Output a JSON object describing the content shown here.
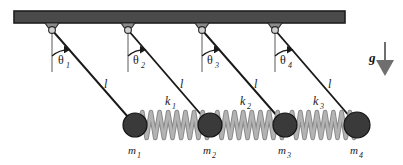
{
  "figure": {
    "type": "physics-diagram",
    "width": 403,
    "height": 165,
    "background": "#ffffff"
  },
  "colors": {
    "ceiling_fill": "#4a4a4a",
    "ceiling_stroke": "#1e1e1e",
    "bracket_fill": "#8c8c8c",
    "bracket_stroke": "#2a2a2a",
    "pin_fill": "#cfcfcf",
    "pin_stroke": "#2a2a2a",
    "rod": "#1a1a1a",
    "mass_fill": "#3a3a3a",
    "mass_stroke": "#141414",
    "spring_fill": "#b3b3b3",
    "spring_stroke": "#8a8a8a",
    "vertical_ref": "#5a5a5a",
    "text": "#1a1a1a",
    "gravity_arrow": "#6f6f6f"
  },
  "ceiling": {
    "name": "ceiling-bar",
    "x": 14,
    "y": 11,
    "width": 331,
    "height": 12
  },
  "pendulums": [
    {
      "id": "pendulum-1",
      "pivot_x": 52,
      "pivot_y": 30,
      "mass_x": 135,
      "mass_y": 125,
      "mass_radius": 12,
      "angle_label": "θ",
      "angle_sub": "1",
      "angle_label_x": 58,
      "angle_label_y": 64,
      "length_label": "l",
      "length_label_x": 104,
      "length_label_y": 88,
      "mass_label": "m",
      "mass_sub": "1",
      "mass_label_x": 128,
      "mass_label_y": 154
    },
    {
      "id": "pendulum-2",
      "pivot_x": 128,
      "pivot_y": 30,
      "mass_x": 210,
      "mass_y": 125,
      "mass_radius": 12,
      "angle_label": "θ",
      "angle_sub": "2",
      "angle_label_x": 133,
      "angle_label_y": 64,
      "length_label": "l",
      "length_label_x": 180,
      "length_label_y": 88,
      "mass_label": "m",
      "mass_sub": "2",
      "mass_label_x": 203,
      "mass_label_y": 154
    },
    {
      "id": "pendulum-3",
      "pivot_x": 202,
      "pivot_y": 30,
      "mass_x": 285,
      "mass_y": 125,
      "mass_radius": 12,
      "angle_label": "θ",
      "angle_sub": "3",
      "angle_label_x": 207,
      "angle_label_y": 64,
      "length_label": "l",
      "length_label_x": 254,
      "length_label_y": 88,
      "mass_label": "m",
      "mass_sub": "3",
      "mass_label_x": 278,
      "mass_label_y": 154
    },
    {
      "id": "pendulum-4",
      "pivot_x": 275,
      "pivot_y": 30,
      "mass_x": 357,
      "mass_y": 125,
      "mass_radius": 13,
      "angle_label": "θ",
      "angle_sub": "4",
      "angle_label_x": 280,
      "angle_label_y": 64,
      "length_label": "l",
      "length_label_x": 328,
      "length_label_y": 88,
      "mass_label": "m",
      "mass_sub": "4",
      "mass_label_x": 350,
      "mass_label_y": 154
    }
  ],
  "springs": [
    {
      "id": "spring-1",
      "label": "k",
      "sub": "1",
      "x1": 135,
      "x2": 210,
      "y": 125,
      "peaks": 8,
      "amplitude": 13,
      "label_x": 165,
      "label_y": 105
    },
    {
      "id": "spring-2",
      "label": "k",
      "sub": "2",
      "x1": 210,
      "x2": 285,
      "y": 125,
      "peaks": 8,
      "amplitude": 13,
      "label_x": 240,
      "label_y": 105
    },
    {
      "id": "spring-3",
      "label": "k",
      "sub": "3",
      "x1": 285,
      "x2": 357,
      "y": 125,
      "peaks": 8,
      "amplitude": 13,
      "label_x": 313,
      "label_y": 105
    }
  ],
  "gravity": {
    "label": "g",
    "label_x": 369,
    "label_y": 62,
    "arrow_x": 385,
    "arrow_y_top": 42,
    "arrow_y_bottom": 74
  }
}
